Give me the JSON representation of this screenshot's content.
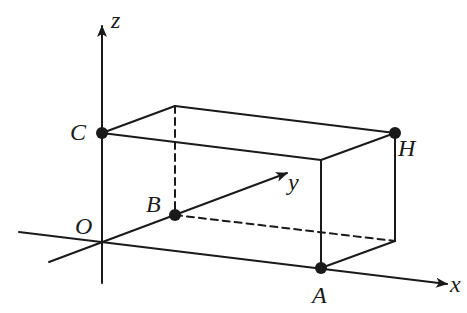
{
  "diagram": {
    "type": "3d-coordinate-box",
    "colors": {
      "stroke": "#1a1a1a",
      "background": "#ffffff"
    },
    "axes": [
      {
        "name": "x",
        "label": "x"
      },
      {
        "name": "y",
        "label": "y"
      },
      {
        "name": "z",
        "label": "z"
      }
    ],
    "points": [
      {
        "name": "O",
        "label": "O",
        "marked": false
      },
      {
        "name": "A",
        "label": "A",
        "marked": true
      },
      {
        "name": "B",
        "label": "B",
        "marked": true
      },
      {
        "name": "C",
        "label": "C",
        "marked": true
      },
      {
        "name": "H",
        "label": "H",
        "marked": true
      }
    ],
    "edges": {
      "solid": [
        "C-TopBack",
        "TopBack-H",
        "C-TopFront",
        "TopFront-H",
        "TopFront-A",
        "H-BackRight",
        "A-BackRight",
        "O-A",
        "O-C"
      ],
      "dashed": [
        "TopBack-B",
        "B-BackRight"
      ]
    }
  }
}
